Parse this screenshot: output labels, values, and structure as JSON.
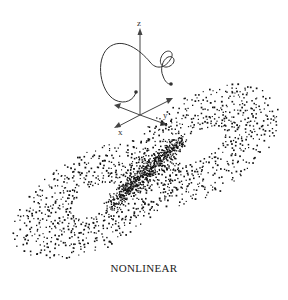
{
  "figure": {
    "caption": "NONLINEAR",
    "axes_inset": {
      "labels": {
        "z": "z",
        "y": "y",
        "x": "x"
      },
      "description": "3D axes with a spiraling trajectory curve"
    },
    "attractor": {
      "description": "Two-lobed dotted strange attractor (butterfly shape)",
      "lobes": [
        "left-lower",
        "right-upper"
      ]
    },
    "colors": {
      "ink": "#111111",
      "axis": "#444444",
      "background": "#ffffff"
    }
  }
}
